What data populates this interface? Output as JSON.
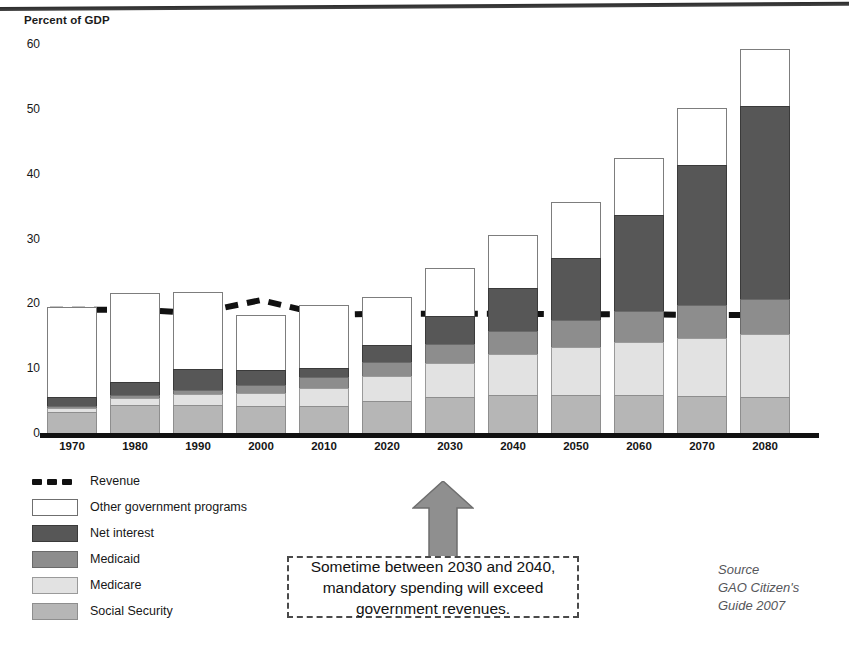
{
  "axis_title": "Percent of GDP",
  "callout": {
    "line1": "Sometime between 2030 and 2040,",
    "line2": "mandatory spending will exceed",
    "line3": "government revenues."
  },
  "source": {
    "line1": "Source",
    "line2": "GAO Citizen's",
    "line3": "Guide 2007"
  },
  "legend": {
    "revenue": "Revenue",
    "other": "Other government programs",
    "net_interest": "Net interest",
    "medicaid": "Medicaid",
    "medicare": "Medicare",
    "social_security": "Social Security"
  },
  "colors": {
    "social_security": "#b6b6b6",
    "medicare": "#e2e2e2",
    "medicaid": "#8d8d8d",
    "net_interest": "#575757",
    "other_programs": "#ffffff",
    "revenue_line": "#111111",
    "arrow": "#8f8f8f"
  },
  "chart_data": {
    "type": "bar",
    "stacked": true,
    "title": "Percent of GDP",
    "xlabel": "",
    "ylabel": "Percent of GDP",
    "ylim": [
      0,
      60
    ],
    "yticks": [
      0,
      10,
      20,
      30,
      40,
      50,
      60
    ],
    "grid": false,
    "legend_position": "below-left",
    "categories": [
      "1970",
      "1980",
      "1990",
      "2000",
      "2010",
      "2020",
      "2030",
      "2040",
      "2050",
      "2060",
      "2070",
      "2080"
    ],
    "series": [
      {
        "name": "Social Security",
        "values": [
          3.2,
          4.3,
          4.3,
          4.1,
          4.2,
          4.9,
          5.6,
          5.9,
          5.9,
          5.8,
          5.7,
          5.6
        ]
      },
      {
        "name": "Medicare",
        "values": [
          0.7,
          1.1,
          1.7,
          2.1,
          2.8,
          3.9,
          5.2,
          6.3,
          7.4,
          8.3,
          9.0,
          9.6
        ]
      },
      {
        "name": "Medicaid",
        "values": [
          0.3,
          0.5,
          0.7,
          1.2,
          1.6,
          2.2,
          2.9,
          3.6,
          4.2,
          4.7,
          5.1,
          5.4
        ]
      },
      {
        "name": "Net interest",
        "values": [
          1.4,
          1.9,
          3.2,
          2.3,
          1.4,
          2.6,
          4.3,
          6.5,
          9.5,
          14.8,
          21.5,
          29.8
        ]
      },
      {
        "name": "Other government programs",
        "values": [
          13.9,
          13.8,
          11.8,
          8.5,
          9.8,
          7.4,
          7.5,
          8.2,
          8.6,
          8.9,
          8.9,
          8.8
        ]
      }
    ],
    "totals": [
      19.5,
      21.6,
      21.7,
      18.2,
      19.8,
      21.0,
      25.5,
      30.5,
      35.6,
      42.5,
      50.2,
      59.2
    ],
    "revenue_line": {
      "name": "Revenue",
      "style": "dashed",
      "values": [
        19.0,
        19.0,
        18.5,
        20.5,
        18.2,
        18.4,
        18.4,
        18.4,
        18.3,
        18.3,
        18.2,
        18.2
      ]
    }
  }
}
